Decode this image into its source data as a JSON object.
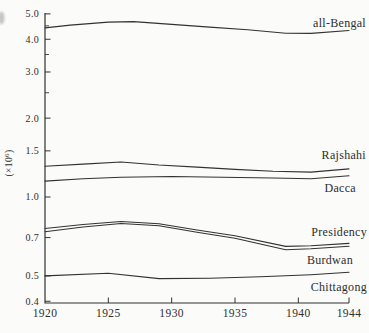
{
  "figure": {
    "background_color": "#fbfbf9",
    "ink_color": "#333230"
  },
  "chart_data": {
    "type": "line",
    "title": "",
    "xlabel": "",
    "ylabel": "(×10⁶)",
    "ylabel_parts": {
      "prefix": "(×10",
      "exponent": "6",
      "suffix": ")"
    },
    "y_scale": "log",
    "grid": false,
    "legend": "labels at right end of each line",
    "xlim": [
      1920,
      1944
    ],
    "ylim": [
      0.4,
      5.0
    ],
    "x_ticks": [
      "1920",
      "1925",
      "1930",
      "1935",
      "1940",
      "1944"
    ],
    "y_major_ticks": [
      {
        "value": 5.0,
        "label": "5.0"
      },
      {
        "value": 4.0,
        "label": "4.0"
      },
      {
        "value": 3.0,
        "label": "3.0"
      },
      {
        "value": 2.0,
        "label": "2.0"
      },
      {
        "value": 1.5,
        "label": "1.5"
      },
      {
        "value": 1.0,
        "label": "1.0"
      },
      {
        "value": 0.7,
        "label": "0.7"
      },
      {
        "value": 0.5,
        "label": "0.5"
      },
      {
        "value": 0.4,
        "label": "0.4"
      }
    ],
    "y_minor_ticks": [
      4.5,
      3.5,
      2.5
    ],
    "series": [
      {
        "name": "all-Bengal",
        "points": [
          [
            1920,
            4.42
          ],
          [
            1922,
            4.53
          ],
          [
            1925,
            4.65
          ],
          [
            1927,
            4.67
          ],
          [
            1930,
            4.56
          ],
          [
            1933,
            4.45
          ],
          [
            1936,
            4.35
          ],
          [
            1939,
            4.22
          ],
          [
            1941,
            4.21
          ],
          [
            1944,
            4.32
          ]
        ]
      },
      {
        "name": "Rajshahi",
        "points": [
          [
            1920,
            1.31
          ],
          [
            1923,
            1.335
          ],
          [
            1926,
            1.36
          ],
          [
            1929,
            1.325
          ],
          [
            1932,
            1.3
          ],
          [
            1935,
            1.275
          ],
          [
            1938,
            1.255
          ],
          [
            1941,
            1.245
          ],
          [
            1944,
            1.28
          ]
        ]
      },
      {
        "name": "Dacca",
        "points": [
          [
            1920,
            1.15
          ],
          [
            1923,
            1.175
          ],
          [
            1926,
            1.19
          ],
          [
            1930,
            1.197
          ],
          [
            1934,
            1.19
          ],
          [
            1938,
            1.182
          ],
          [
            1941,
            1.175
          ],
          [
            1944,
            1.205
          ]
        ]
      },
      {
        "name": "Presidency",
        "points": [
          [
            1920,
            0.758
          ],
          [
            1923,
            0.785
          ],
          [
            1926,
            0.806
          ],
          [
            1929,
            0.79
          ],
          [
            1932,
            0.748
          ],
          [
            1935,
            0.712
          ],
          [
            1939,
            0.648
          ],
          [
            1941,
            0.652
          ],
          [
            1944,
            0.665
          ]
        ]
      },
      {
        "name": "Burdwan",
        "points": [
          [
            1920,
            0.737
          ],
          [
            1923,
            0.768
          ],
          [
            1926,
            0.792
          ],
          [
            1929,
            0.777
          ],
          [
            1932,
            0.733
          ],
          [
            1935,
            0.696
          ],
          [
            1939,
            0.629
          ],
          [
            1941,
            0.635
          ],
          [
            1944,
            0.649
          ]
        ]
      },
      {
        "name": "Chittagong",
        "points": [
          [
            1920,
            0.5
          ],
          [
            1925,
            0.512
          ],
          [
            1929,
            0.488
          ],
          [
            1933,
            0.49
          ],
          [
            1937,
            0.496
          ],
          [
            1941,
            0.505
          ],
          [
            1944,
            0.516
          ]
        ]
      }
    ]
  }
}
